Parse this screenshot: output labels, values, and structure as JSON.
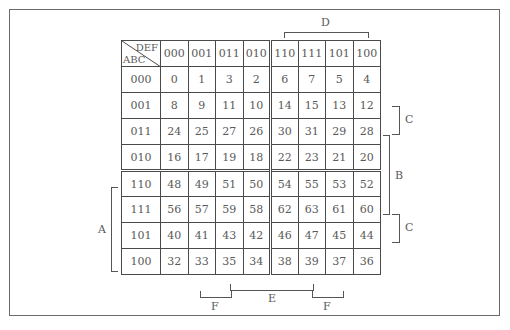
{
  "kmap": {
    "corner": {
      "col_vars": "DEF",
      "row_vars": "ABC"
    },
    "col_headers": [
      "000",
      "001",
      "011",
      "010",
      "110",
      "111",
      "101",
      "100"
    ],
    "rows": [
      {
        "label": "000",
        "cells": [
          "0",
          "1",
          "3",
          "2",
          "6",
          "7",
          "5",
          "4"
        ]
      },
      {
        "label": "001",
        "cells": [
          "8",
          "9",
          "11",
          "10",
          "14",
          "15",
          "13",
          "12"
        ]
      },
      {
        "label": "011",
        "cells": [
          "24",
          "25",
          "27",
          "26",
          "30",
          "31",
          "29",
          "28"
        ]
      },
      {
        "label": "010",
        "cells": [
          "16",
          "17",
          "19",
          "18",
          "22",
          "23",
          "21",
          "20"
        ]
      },
      {
        "label": "110",
        "cells": [
          "48",
          "49",
          "51",
          "50",
          "54",
          "55",
          "53",
          "52"
        ]
      },
      {
        "label": "111",
        "cells": [
          "56",
          "57",
          "59",
          "58",
          "62",
          "63",
          "61",
          "60"
        ]
      },
      {
        "label": "101",
        "cells": [
          "40",
          "41",
          "43",
          "42",
          "46",
          "47",
          "45",
          "44"
        ]
      },
      {
        "label": "100",
        "cells": [
          "32",
          "33",
          "35",
          "34",
          "38",
          "39",
          "37",
          "36"
        ]
      }
    ]
  },
  "brackets": {
    "top": {
      "label": "D",
      "covers_columns": [
        "110",
        "111",
        "101",
        "100"
      ]
    },
    "left": {
      "label": "A",
      "covers_rows": [
        "110",
        "111",
        "101",
        "100"
      ]
    },
    "right": [
      {
        "label": "C",
        "covers_rows": [
          "001",
          "011"
        ]
      },
      {
        "label": "B",
        "covers_rows": [
          "011",
          "010",
          "110",
          "111"
        ]
      },
      {
        "label": "C",
        "covers_rows": [
          "111",
          "101"
        ]
      }
    ],
    "bottom": [
      {
        "label": "F",
        "covers_columns": [
          "001",
          "011"
        ]
      },
      {
        "label": "E",
        "covers_columns": [
          "011",
          "010",
          "110",
          "111"
        ]
      },
      {
        "label": "F",
        "covers_columns": [
          "111",
          "101"
        ]
      }
    ]
  },
  "colors": {
    "line": "#4a4a4a",
    "text": "#5a5a5a",
    "frame": "#6a6a6a"
  }
}
